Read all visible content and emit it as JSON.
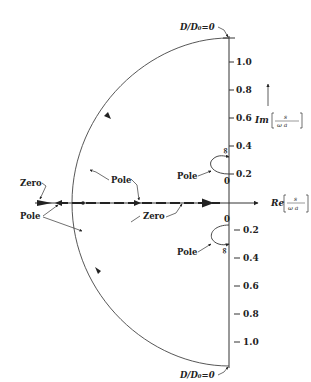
{
  "diagram": {
    "type": "root-locus / complex s-plane plot",
    "axes": {
      "real_axis_label": "Re",
      "real_axis_fraction_num": "s",
      "real_axis_fraction_den": "ω a",
      "imag_axis_label": "Im",
      "imag_axis_fraction_num": "s",
      "imag_axis_fraction_den": "ω a"
    },
    "upper_ticks": [
      "1.0",
      "0.8",
      "0.6",
      "0.4",
      "0.2"
    ],
    "lower_ticks": [
      "0.2",
      "0.4",
      "0.6",
      "0.8",
      "1.0"
    ],
    "origin_label": "0",
    "top_annotation": "D/D₀=0",
    "bottom_annotation": "D/D₀=0",
    "labels": {
      "zero_left": "Zero",
      "pole_left": "Pole",
      "pole_arc": "Pole",
      "pole_axis": "Pole",
      "zero_axis": "Zero",
      "pole_upper_small": "Pole",
      "pole_lower_small": "Pole"
    },
    "small_loop_upper": {
      "start": "0",
      "end": "∞"
    },
    "small_loop_lower": {
      "start": "0",
      "end": "∞"
    },
    "colors": {
      "ink": "#333333",
      "background": "#ffffff"
    }
  }
}
